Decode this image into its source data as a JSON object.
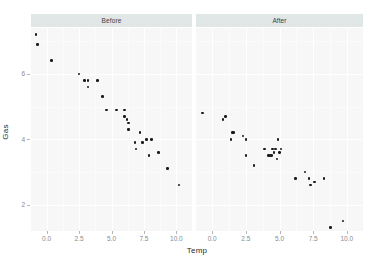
{
  "chart_data": {
    "type": "scatter",
    "title": "",
    "xlabel": "Temp",
    "ylabel": "Gas",
    "xlim": [
      -1.2,
      11.2
    ],
    "ylim": [
      1.2,
      7.4
    ],
    "xticks": [
      0.0,
      2.5,
      5.0,
      7.5,
      10.0
    ],
    "xtick_labels": [
      "0.0",
      "2.5",
      "5.0",
      "7.5",
      "10.0"
    ],
    "yticks": [
      2,
      4,
      6
    ],
    "ytick_labels": [
      "2",
      "4",
      "6"
    ],
    "grid": true,
    "legend": "none",
    "facet_variable": "Insul",
    "facets": [
      {
        "label": "Before",
        "points": [
          {
            "x": -0.8,
            "y": 7.2
          },
          {
            "x": -0.7,
            "y": 6.9
          },
          {
            "x": 0.4,
            "y": 6.4
          },
          {
            "x": 2.5,
            "y": 6.0
          },
          {
            "x": 2.9,
            "y": 5.8
          },
          {
            "x": 3.2,
            "y": 5.8
          },
          {
            "x": 3.2,
            "y": 5.6
          },
          {
            "x": 3.9,
            "y": 5.8
          },
          {
            "x": 4.3,
            "y": 5.3
          },
          {
            "x": 4.6,
            "y": 4.9
          },
          {
            "x": 5.4,
            "y": 4.9
          },
          {
            "x": 6.0,
            "y": 4.9
          },
          {
            "x": 6.0,
            "y": 4.7
          },
          {
            "x": 6.2,
            "y": 4.6
          },
          {
            "x": 6.3,
            "y": 4.5
          },
          {
            "x": 6.3,
            "y": 4.3
          },
          {
            "x": 6.8,
            "y": 3.9
          },
          {
            "x": 6.9,
            "y": 3.7
          },
          {
            "x": 7.2,
            "y": 4.2
          },
          {
            "x": 7.4,
            "y": 3.9
          },
          {
            "x": 7.7,
            "y": 4.0
          },
          {
            "x": 7.9,
            "y": 3.5
          },
          {
            "x": 8.1,
            "y": 4.0
          },
          {
            "x": 8.6,
            "y": 3.6
          },
          {
            "x": 9.3,
            "y": 3.1
          },
          {
            "x": 10.2,
            "y": 2.6
          }
        ]
      },
      {
        "label": "After",
        "points": [
          {
            "x": -0.7,
            "y": 4.8
          },
          {
            "x": 0.8,
            "y": 4.6
          },
          {
            "x": 1.0,
            "y": 4.7
          },
          {
            "x": 1.4,
            "y": 4.0
          },
          {
            "x": 1.5,
            "y": 4.2
          },
          {
            "x": 1.6,
            "y": 4.2
          },
          {
            "x": 2.3,
            "y": 4.1
          },
          {
            "x": 2.5,
            "y": 4.0
          },
          {
            "x": 2.5,
            "y": 3.5
          },
          {
            "x": 3.1,
            "y": 3.2
          },
          {
            "x": 3.9,
            "y": 3.7
          },
          {
            "x": 4.2,
            "y": 3.5
          },
          {
            "x": 4.3,
            "y": 3.5
          },
          {
            "x": 4.4,
            "y": 3.5
          },
          {
            "x": 4.5,
            "y": 3.7
          },
          {
            "x": 4.6,
            "y": 3.6
          },
          {
            "x": 4.7,
            "y": 3.7
          },
          {
            "x": 4.8,
            "y": 3.4
          },
          {
            "x": 4.9,
            "y": 4.0
          },
          {
            "x": 5.0,
            "y": 3.6
          },
          {
            "x": 5.1,
            "y": 3.7
          },
          {
            "x": 6.2,
            "y": 2.8
          },
          {
            "x": 6.9,
            "y": 3.0
          },
          {
            "x": 7.2,
            "y": 2.8
          },
          {
            "x": 7.3,
            "y": 2.6
          },
          {
            "x": 7.6,
            "y": 2.7
          },
          {
            "x": 8.3,
            "y": 2.8
          },
          {
            "x": 8.8,
            "y": 1.3
          },
          {
            "x": 9.7,
            "y": 1.5
          }
        ]
      }
    ]
  }
}
